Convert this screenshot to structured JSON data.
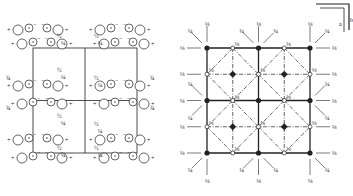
{
  "figure": {
    "left_panel": {
      "kind": "general-positions",
      "cell": {
        "x": 33,
        "y": 48,
        "w": 104,
        "h": 105
      },
      "labels": {
        "plus": "+",
        "minus": "−",
        "half": "½",
        "quarter": "¼",
        "three_quarter": "¾",
        "comma": ","
      }
    },
    "right_panel": {
      "kind": "symmetry-elements",
      "grid": {
        "x": 207,
        "y": 48,
        "w": 103,
        "h": 105
      },
      "fraction_eighth": "⅛",
      "fraction_quarter": "¼",
      "axes": {
        "a": "a",
        "b": "b"
      }
    },
    "colors": {
      "ink": "#222222",
      "background": "#ffffff"
    }
  }
}
